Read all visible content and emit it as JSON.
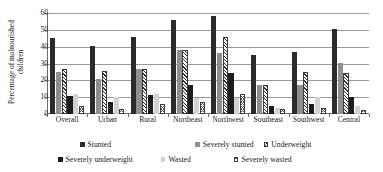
{
  "chart_data": {
    "type": "bar",
    "title": "",
    "xlabel": "",
    "ylabel": "Percentage of malnourished children",
    "ylabel_line1": "Percentage of malnourished",
    "ylabel_line2": "children",
    "ylim": [
      0,
      60
    ],
    "yticks": [
      0,
      10,
      20,
      30,
      40,
      50,
      60
    ],
    "grid": true,
    "legend_position": "bottom",
    "categories": [
      "Overall",
      "Urban",
      "Rural",
      "Northeast",
      "Northwest",
      "Southeast",
      "Southwest",
      "Central"
    ],
    "series": [
      {
        "name": "Stunted",
        "color": "#2b2b2b",
        "pattern": "solid",
        "values": [
          45.0,
          40.5,
          46.0,
          56.0,
          58.0,
          34.8,
          37.0,
          50.5
        ]
      },
      {
        "name": "Severely stunted",
        "color": "#8f8f8f",
        "pattern": "solid-gray",
        "values": [
          25.0,
          21.0,
          26.5,
          38.2,
          36.0,
          17.5,
          17.5,
          30.5
        ]
      },
      {
        "name": "Underweight",
        "color": "#ffffff",
        "pattern": "diagonal-hatch",
        "values": [
          26.8,
          25.8,
          26.5,
          38.0,
          45.8,
          17.5,
          25.0,
          24.2
        ]
      },
      {
        "name": "Severely underweight",
        "color": "#1c1c1c",
        "pattern": "solid",
        "values": [
          10.5,
          7.0,
          11.0,
          17.5,
          24.2,
          5.0,
          6.0,
          10.0
        ]
      },
      {
        "name": "Wasted",
        "color": "#d2d2d2",
        "pattern": "solid-light",
        "values": [
          12.0,
          10.0,
          12.0,
          9.5,
          9.5,
          3.5,
          10.0,
          4.5
        ]
      },
      {
        "name": "Severely wasted",
        "color": "#ffffff",
        "pattern": "cross-hatch",
        "values": [
          4.8,
          3.0,
          5.8,
          7.2,
          11.8,
          2.8,
          3.5,
          2.5
        ]
      }
    ]
  }
}
